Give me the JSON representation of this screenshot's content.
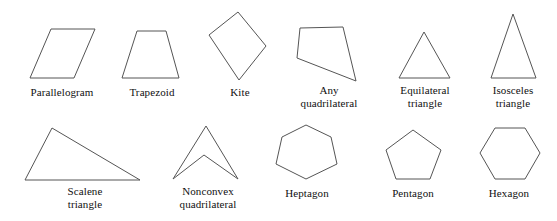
{
  "figure": {
    "background_color": "#ffffff",
    "stroke_color": "#555555",
    "fill_color": "none",
    "stroke_width": 1,
    "width": 557,
    "height": 221
  },
  "rows": [
    {
      "row_index": 0,
      "shapes": [
        {
          "id": "parallelogram",
          "label": "Parallelogram",
          "label_lines": [
            "Parallelogram"
          ],
          "sides": 4,
          "shape_kind": "quadrilateral",
          "points": "30,78 51,29 95,29 74,78",
          "label_x": 12,
          "label_y": 86,
          "label_w": 100
        },
        {
          "id": "trapezoid",
          "label": "Trapezoid",
          "label_lines": [
            "Trapezoid"
          ],
          "sides": 4,
          "shape_kind": "quadrilateral",
          "points": "122,78 137,31 166,31 179,78",
          "label_x": 112,
          "label_y": 86,
          "label_w": 80
        },
        {
          "id": "kite",
          "label": "Kite",
          "label_lines": [
            "Kite"
          ],
          "sides": 4,
          "shape_kind": "quadrilateral",
          "points": "238,12 266,46 239,80 209,35",
          "label_x": 211,
          "label_y": 86,
          "label_w": 58
        },
        {
          "id": "any-quadrilateral",
          "label": "Any quadrilateral",
          "label_lines": [
            "Any",
            "quadrilateral"
          ],
          "sides": 4,
          "shape_kind": "quadrilateral",
          "points": "300,28 343,27 356,81 297,58",
          "label_x": 286,
          "label_y": 84,
          "label_w": 86
        },
        {
          "id": "equilateral-triangle",
          "label": "Equilateral triangle",
          "label_lines": [
            "Equilateral",
            "triangle"
          ],
          "sides": 3,
          "shape_kind": "triangle",
          "points": "424,32 450,78 399,78",
          "label_x": 382,
          "label_y": 84,
          "label_w": 86
        },
        {
          "id": "isosceles-triangle",
          "label": "Isosceles triangle",
          "label_lines": [
            "Isosceles",
            "triangle"
          ],
          "sides": 3,
          "shape_kind": "triangle",
          "points": "513,14 536,78 491,78",
          "label_x": 473,
          "label_y": 84,
          "label_w": 80
        }
      ]
    },
    {
      "row_index": 1,
      "shapes": [
        {
          "id": "scalene-triangle",
          "label": "Scalene triangle",
          "label_lines": [
            "Scalene",
            "triangle"
          ],
          "sides": 3,
          "shape_kind": "triangle",
          "points": "52,128 140,180 25,180",
          "label_x": 40,
          "label_y": 185,
          "label_w": 90
        },
        {
          "id": "nonconvex-quadrilateral",
          "label": "Nonconvex quadrilateral",
          "label_lines": [
            "Nonconvex",
            "quadrilateral"
          ],
          "sides": 4,
          "shape_kind": "quadrilateral",
          "points": "206,126 238,179 204,155 173,179",
          "label_x": 163,
          "label_y": 185,
          "label_w": 90
        },
        {
          "id": "heptagon",
          "label": "Heptagon",
          "label_lines": [
            "Heptagon"
          ],
          "sides": 7,
          "shape_kind": "regular-polygon",
          "points": "306,125 331,137 337,164 306,179 276,164 282,137",
          "label_x": 268,
          "label_y": 187,
          "label_w": 78
        },
        {
          "id": "pentagon",
          "label": "Pentagon",
          "label_lines": [
            "Pentagon"
          ],
          "sides": 5,
          "shape_kind": "regular-polygon",
          "points": "413,130 441,150 430,179 396,179 386,150",
          "label_x": 374,
          "label_y": 187,
          "label_w": 78
        },
        {
          "id": "hexagon",
          "label": "Hexagon",
          "label_lines": [
            "Hexagon"
          ],
          "sides": 6,
          "shape_kind": "regular-polygon",
          "points": "495,128 525,128 540,153 525,179 495,179 480,153",
          "label_x": 470,
          "label_y": 187,
          "label_w": 78
        }
      ]
    }
  ]
}
